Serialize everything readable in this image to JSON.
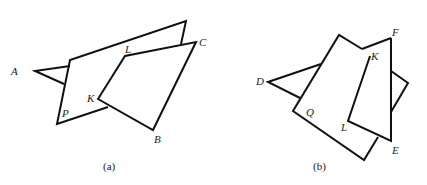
{
  "figures": [
    {
      "id": "a",
      "caption": "(a)",
      "labels": {
        "A": "A",
        "P": "P",
        "K": "K",
        "L": "L",
        "C": "C",
        "B": "B"
      },
      "shapes": {
        "triangle_A": [
          [
            35,
            71
          ],
          [
            70,
            60
          ],
          [
            64,
            85
          ]
        ],
        "back_polygon": [
          [
            70,
            60
          ],
          [
            186,
            21
          ],
          [
            181,
            44
          ],
          [
            108,
            107
          ],
          [
            57,
            124
          ],
          [
            64,
            85
          ]
        ],
        "front_quad_KLCB": [
          [
            98,
            99
          ],
          [
            125,
            56
          ],
          [
            196,
            42
          ],
          [
            153,
            130
          ]
        ]
      }
    },
    {
      "id": "b",
      "caption": "(b)",
      "labels": {
        "D": "D",
        "Q": "Q",
        "L": "L",
        "K": "K",
        "F": "F",
        "E": "E"
      },
      "shapes": {
        "triangle_D": [
          [
            268,
            82
          ],
          [
            322,
            64
          ],
          [
            300,
            98
          ]
        ],
        "rectangle_Q": [
          [
            339,
            35
          ],
          [
            293,
            111
          ],
          [
            364,
            160
          ],
          [
            378,
            137
          ]
        ],
        "quad_KFEL": [
          [
            370,
            56
          ],
          [
            391,
            38
          ],
          [
            391,
            141
          ],
          [
            348,
            121
          ]
        ],
        "protrusion_right": [
          [
            391,
            71
          ],
          [
            408,
            83
          ],
          [
            391,
            112
          ]
        ]
      }
    }
  ]
}
